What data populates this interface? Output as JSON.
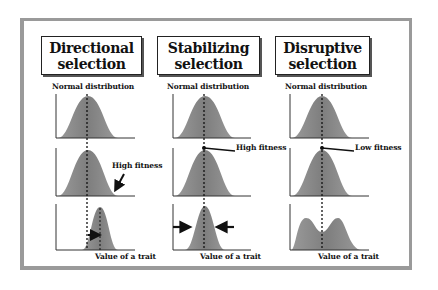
{
  "columns": [
    {
      "title_line1": "Directional",
      "title_line2": "selection",
      "top_label": "Normal distribution",
      "fitness_label": "High fitness",
      "bottom_label": "Value of a trait"
    },
    {
      "title_line1": "Stabilizing",
      "title_line2": "selection",
      "top_label": "Normal distribution",
      "fitness_label": "High fitness",
      "bottom_label": "Value of a trait"
    },
    {
      "title_line1": "Disruptive",
      "title_line2": "selection",
      "top_label": "Normal distribution",
      "fitness_label": "Low fitness",
      "bottom_label": "Value of a trait"
    }
  ],
  "colors": {
    "curve_fill": "#8c8c8c",
    "curve_dark": "#6e6e6e",
    "frame": "#9a9a9a",
    "axis": "#333333",
    "text": "#111111"
  }
}
